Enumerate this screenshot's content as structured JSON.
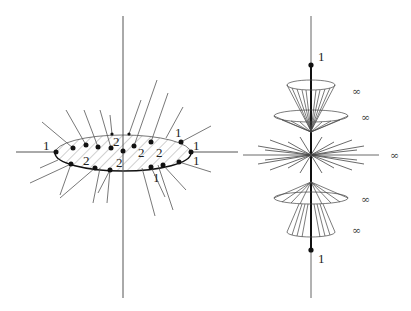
{
  "figure": {
    "left_panel": {
      "description": "Hatched ellipse (disk) with radial lines emanating, crossed by vertical axis and horizontal axis; dots on boundary and interior labeled with multiplicities",
      "labels": {
        "left_edge": "1",
        "top_right_1": "1",
        "right_1": "1",
        "right_2": "1",
        "bottom_right": "1",
        "interior_a": "2",
        "interior_b": "2",
        "interior_c": "2",
        "interior_d": "2",
        "interior_e": "2"
      }
    },
    "right_panel": {
      "description": "Vertical axis with stacked cones and central star of lines; points at top and bottom labeled 1, cones labeled infinity",
      "labels": {
        "top_point": "1",
        "bottom_point": "1",
        "cone_top_upper": "∞",
        "cone_top_lower": "∞",
        "star_center": "∞",
        "cone_bottom_upper": "∞",
        "cone_bottom_lower": "∞"
      }
    },
    "colors": {
      "line": "#333333",
      "light_line": "#555555",
      "hatch": "#777777",
      "dot": "#111111"
    }
  }
}
